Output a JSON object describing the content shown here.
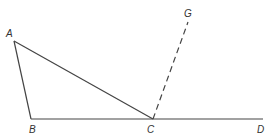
{
  "diagram": {
    "points": {
      "A": {
        "label": "A",
        "x": 14,
        "y": 41
      },
      "B": {
        "label": "B",
        "x": 31,
        "y": 119
      },
      "C": {
        "label": "C",
        "x": 153,
        "y": 119
      },
      "D": {
        "label": "D",
        "x": 263,
        "y": 119
      },
      "G": {
        "label": "G",
        "x": 188,
        "y": 22
      }
    },
    "segments": [
      {
        "from": "A",
        "to": "B",
        "style": "solid"
      },
      {
        "from": "A",
        "to": "C",
        "style": "solid"
      },
      {
        "from": "B",
        "to": "D",
        "style": "solid"
      },
      {
        "from": "C",
        "to": "G",
        "style": "dashed"
      }
    ],
    "line_color": "#444444"
  }
}
